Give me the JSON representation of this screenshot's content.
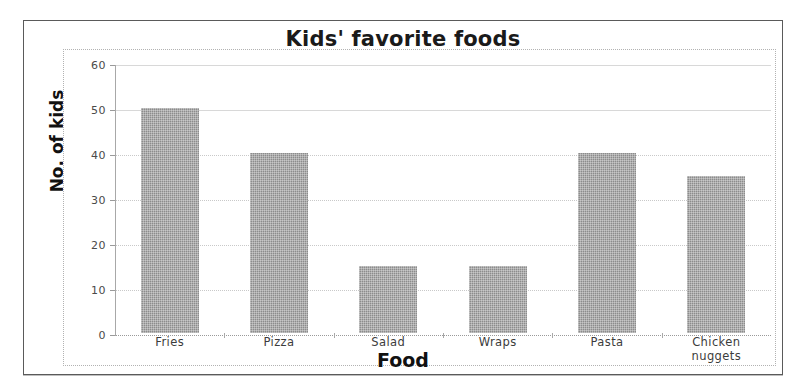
{
  "chart_data": {
    "type": "bar",
    "title": "Kids' favorite foods",
    "xlabel": "Food",
    "ylabel": "No. of kids",
    "categories": [
      "Fries",
      "Pizza",
      "Salad",
      "Wraps",
      "Pasta",
      "Chicken\nnuggets"
    ],
    "values": [
      50,
      40,
      15,
      15,
      40,
      35
    ],
    "ylim": [
      0,
      60
    ],
    "ytick_labels": [
      "0",
      "10",
      "20",
      "30",
      "40",
      "50",
      "60"
    ],
    "ytick_values": [
      0,
      10,
      20,
      30,
      40,
      50,
      60
    ],
    "grid": true,
    "legend": "none",
    "bar_color": "#8c8c8c",
    "plot_background": "#ffffff",
    "frame_color": "#5a5a5a"
  }
}
